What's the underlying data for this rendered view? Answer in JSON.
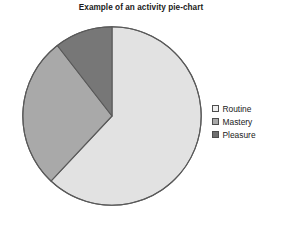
{
  "chart_data": {
    "type": "pie",
    "title": "Example of an activity pie-chart",
    "xlabel": "",
    "ylabel": "",
    "grid": false,
    "legend_position": "right",
    "start_angle_deg": 0,
    "direction": "clockwise",
    "categories": [
      "Routine",
      "Mastery",
      "Pleasure"
    ],
    "values": [
      62,
      27.5,
      10.5
    ],
    "units": "percent",
    "slices": [
      {
        "label": "Routine",
        "value": 62,
        "angle_deg": 223.2,
        "start_deg": 0,
        "end_deg": 223.2,
        "color": "#e2e2e2",
        "swatch_color": "#eeeeee"
      },
      {
        "label": "Mastery",
        "value": 27.5,
        "angle_deg": 99,
        "start_deg": 223.2,
        "end_deg": 322.2,
        "color": "#a9a9a9",
        "swatch_color": "#a9a9a9"
      },
      {
        "label": "Pleasure",
        "value": 10.5,
        "angle_deg": 37.8,
        "start_deg": 322.2,
        "end_deg": 360,
        "color": "#777777",
        "swatch_color": "#6f6f6f"
      }
    ],
    "legend": [
      {
        "label": "Routine",
        "color": "#eeeeee"
      },
      {
        "label": "Mastery",
        "color": "#a9a9a9"
      },
      {
        "label": "Pleasure",
        "color": "#6f6f6f"
      }
    ],
    "outline_color": "#595959"
  }
}
